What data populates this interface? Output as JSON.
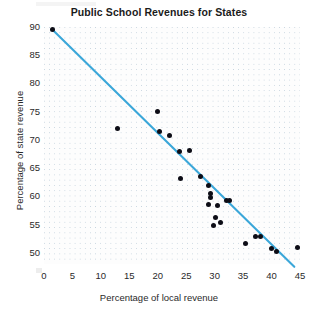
{
  "chart_data": {
    "type": "scatter",
    "title": "Public School Revenues for States",
    "xlabel": "Percentage of local revenue",
    "ylabel": "Percentage of state revenue",
    "xlim": [
      0,
      45
    ],
    "ylim": [
      48,
      90
    ],
    "xticks": [
      0,
      5,
      10,
      15,
      20,
      25,
      30,
      35,
      40,
      45
    ],
    "yticks": [
      50,
      55,
      60,
      65,
      70,
      75,
      80,
      85,
      90
    ],
    "grid": true,
    "legend": "none",
    "point_color": "#0d0d16",
    "trend_color": "#3ba7d9",
    "points": [
      {
        "x": 1.5,
        "y": 89.5
      },
      {
        "x": 13.0,
        "y": 72.0
      },
      {
        "x": 20.0,
        "y": 75.0
      },
      {
        "x": 20.3,
        "y": 71.5
      },
      {
        "x": 22.0,
        "y": 70.8
      },
      {
        "x": 23.8,
        "y": 68.0
      },
      {
        "x": 25.5,
        "y": 68.2
      },
      {
        "x": 24.0,
        "y": 63.2
      },
      {
        "x": 27.5,
        "y": 63.5
      },
      {
        "x": 29.0,
        "y": 62.0
      },
      {
        "x": 29.2,
        "y": 60.5
      },
      {
        "x": 29.3,
        "y": 59.8
      },
      {
        "x": 29.0,
        "y": 58.5
      },
      {
        "x": 30.5,
        "y": 58.4
      },
      {
        "x": 32.0,
        "y": 59.2
      },
      {
        "x": 32.6,
        "y": 59.2
      },
      {
        "x": 30.2,
        "y": 56.2
      },
      {
        "x": 31.0,
        "y": 55.4
      },
      {
        "x": 29.8,
        "y": 54.8
      },
      {
        "x": 37.2,
        "y": 52.8
      },
      {
        "x": 38.0,
        "y": 52.8
      },
      {
        "x": 35.5,
        "y": 51.6
      },
      {
        "x": 40.0,
        "y": 50.8
      },
      {
        "x": 40.8,
        "y": 50.2
      },
      {
        "x": 44.5,
        "y": 51.0
      }
    ],
    "trend_line": {
      "x_start": 1.5,
      "y_start": 89.5,
      "x_end": 44.0,
      "y_end": 47.5
    }
  }
}
